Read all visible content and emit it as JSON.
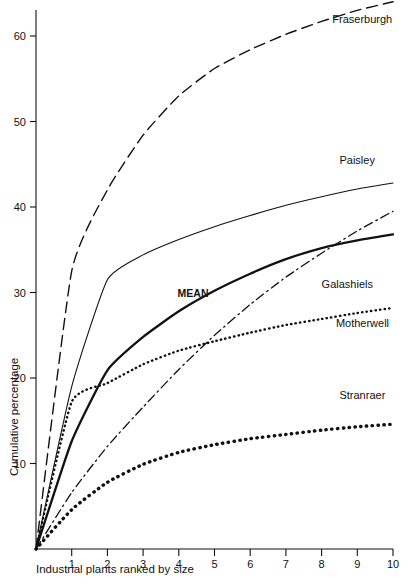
{
  "chart_data": {
    "type": "line",
    "title": "",
    "xlabel": "Industrial plants ranked by size",
    "ylabel": "Cumulative percentage",
    "xlim": [
      0,
      10
    ],
    "ylim": [
      0,
      64
    ],
    "grid": false,
    "legend": "inline-labels",
    "xticks": [
      "1",
      "2",
      "3",
      "4",
      "5",
      "6",
      "7",
      "8",
      "9",
      "10"
    ],
    "xtick_values": [
      1,
      2,
      3,
      4,
      5,
      6,
      7,
      8,
      9,
      10
    ],
    "yticks": [
      "10",
      "20",
      "30",
      "40",
      "50",
      "60"
    ],
    "ytick_values": [
      10,
      20,
      30,
      40,
      50,
      60
    ],
    "x": [
      0,
      1,
      2,
      3,
      4,
      5,
      6,
      7,
      8,
      9,
      10
    ],
    "series": [
      {
        "name": "Fraserburgh",
        "style": "dashed",
        "label": "Fraserburgh",
        "values": [
          0,
          32.5,
          42.0,
          48.4,
          53.0,
          56.2,
          58.4,
          60.2,
          61.7,
          63.0,
          64.0
        ]
      },
      {
        "name": "Paisley",
        "style": "solid-thin",
        "label": "Paisley",
        "values": [
          0,
          19.0,
          31.5,
          34.4,
          36.2,
          37.7,
          39.0,
          40.2,
          41.2,
          42.1,
          42.8
        ]
      },
      {
        "name": "MEAN",
        "style": "solid-thick",
        "label": "MEAN",
        "values": [
          0,
          12.6,
          20.9,
          24.8,
          27.8,
          30.2,
          32.2,
          33.9,
          35.2,
          36.1,
          36.8
        ]
      },
      {
        "name": "Galashiels",
        "style": "dash-dot",
        "label": "Galashiels",
        "values": [
          0,
          6.6,
          12.0,
          16.6,
          21.0,
          25.0,
          28.6,
          31.8,
          34.6,
          37.2,
          39.5
        ]
      },
      {
        "name": "Motherwell",
        "style": "dotted-fine",
        "label": "Motherwell",
        "values": [
          0,
          17.2,
          19.4,
          21.6,
          23.2,
          24.3,
          25.3,
          26.2,
          26.9,
          27.6,
          28.2
        ]
      },
      {
        "name": "Stranraer",
        "style": "dotted-bold",
        "label": "Stranraer",
        "values": [
          0,
          4.6,
          7.8,
          9.9,
          11.3,
          12.2,
          12.9,
          13.4,
          13.9,
          14.3,
          14.6
        ]
      }
    ],
    "annotations": [
      {
        "text": "Fraserburgh",
        "x": 8.3,
        "y": 61.5
      },
      {
        "text": "Paisley",
        "x": 8.5,
        "y": 45.0
      },
      {
        "text": "Galashiels",
        "x": 8.0,
        "y": 30.5
      },
      {
        "text": "Motherwell",
        "x": 8.4,
        "y": 26.0
      },
      {
        "text": "Stranraer",
        "x": 8.5,
        "y": 17.5
      },
      {
        "text": "MEAN",
        "x": 4.4,
        "y": 29.5
      }
    ],
    "colors": {
      "axis": "#111111",
      "curve": "#111111",
      "background": "#ffffff"
    }
  }
}
